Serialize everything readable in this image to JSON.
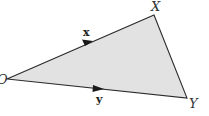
{
  "diagram": {
    "type": "vector-triangle",
    "fill_color": "#e2e2e2",
    "stroke_color": "#2a2a2a",
    "vertices": {
      "O": {
        "label": "O",
        "x": 7,
        "y": 79
      },
      "X": {
        "label": "X",
        "x": 154,
        "y": 15
      },
      "Y": {
        "label": "Y",
        "x": 187,
        "y": 98
      }
    },
    "vectors": [
      {
        "name": "x",
        "label": "x",
        "from": "O",
        "to": "X"
      },
      {
        "name": "y",
        "label": "y",
        "from": "O",
        "to": "Y"
      }
    ],
    "labels": {
      "O": "O",
      "X": "X",
      "Y": "Y",
      "x": "x",
      "y": "y"
    }
  }
}
